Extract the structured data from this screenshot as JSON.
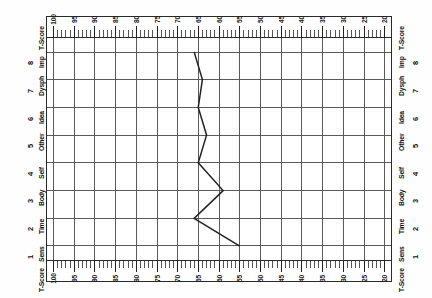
{
  "chart_data": {
    "type": "line",
    "title": "",
    "orientation": "rotated-90",
    "xlabel": "T-Score",
    "ylabel": "",
    "axis_title": "T-Score",
    "scale_min": 20,
    "scale_max": 100,
    "tick_step_major": 5,
    "tick_step_minor": 1,
    "tick_labels": [
      100,
      95,
      90,
      85,
      80,
      75,
      70,
      65,
      60,
      55,
      50,
      45,
      40,
      35,
      30,
      25,
      20
    ],
    "gridline_values": [
      100,
      95,
      90,
      85,
      80,
      75,
      70,
      65,
      60,
      55,
      50,
      45,
      40,
      35,
      30,
      25,
      20
    ],
    "grid": true,
    "legend": "none",
    "categories": [
      "Sens",
      "Time",
      "Body",
      "Self",
      "Other",
      "Idea",
      "Dysph",
      "Imp"
    ],
    "category_numbers": [
      1,
      2,
      3,
      4,
      5,
      6,
      7,
      8
    ],
    "values": [
      55,
      66,
      59,
      65,
      63,
      65,
      64,
      66
    ],
    "series": [
      {
        "name": "profile",
        "values": [
          55,
          66,
          59,
          65,
          63,
          65,
          64,
          66
        ]
      }
    ]
  },
  "chart": {
    "axis_label_top": "T-Score",
    "axis_label_bottom": "T-Score",
    "rows": [
      {
        "number": "8",
        "name": "Imp",
        "value": 66
      },
      {
        "number": "7",
        "name": "Dysph",
        "value": 64
      },
      {
        "number": "6",
        "name": "Idea",
        "value": 65
      },
      {
        "number": "5",
        "name": "Other",
        "value": 63
      },
      {
        "number": "4",
        "name": "Self",
        "value": 65
      },
      {
        "number": "3",
        "name": "Body",
        "value": 59
      },
      {
        "number": "2",
        "name": "Time",
        "value": 66
      },
      {
        "number": "1",
        "name": "Sens",
        "value": 55
      }
    ],
    "corner_label": "T-Score",
    "line_color": "#222222",
    "grid_color": "#5a5a5a",
    "frame_color": "#2a2a2a"
  }
}
